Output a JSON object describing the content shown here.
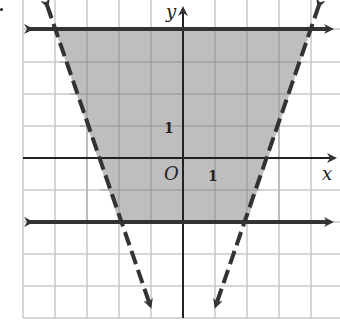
{
  "figure": {
    "type": "inequality-graph",
    "axes": {
      "x_label": "x",
      "y_label": "y",
      "origin_label": "O",
      "x_tick_label": "1",
      "y_tick_label": "1",
      "x_range": [
        -5,
        5
      ],
      "y_range": [
        -5,
        5
      ],
      "grid": true
    },
    "boundaries": [
      {
        "name": "top-line",
        "equation": "y = 4",
        "style": "solid",
        "arrows": "both"
      },
      {
        "name": "bottom-line",
        "equation": "y = -2",
        "style": "solid",
        "arrows": "both"
      },
      {
        "name": "left-line",
        "equation": "y = -3x - 8",
        "style": "dashed",
        "arrows": "both"
      },
      {
        "name": "right-line",
        "equation": "y = 3x - 8",
        "style": "dashed",
        "arrows": "both"
      }
    ],
    "shaded_region": {
      "description": "Trapezoid bounded by y=4 (top), y=-2 (bottom), y=-3x-8 (left), y=3x-8 (right)",
      "vertices": [
        [
          -4,
          4
        ],
        [
          4,
          4
        ],
        [
          2,
          -2
        ],
        [
          -2,
          -2
        ]
      ],
      "fill_color": "#b3b3b3"
    },
    "colors": {
      "grid": "#c8c8c8",
      "axis": "#222222",
      "boundary": "#333333",
      "shade": "#b3b3b3"
    }
  }
}
